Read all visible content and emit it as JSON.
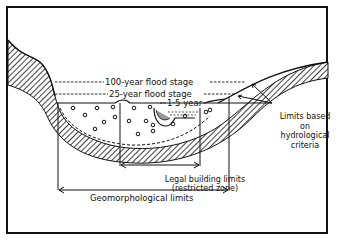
{
  "diagram": {
    "labels": {
      "flood_100": "100-year flood stage",
      "flood_25": "25-year flood stage",
      "flood_1_5": "1·5 year",
      "hydro_line1": "Limits based",
      "hydro_line2": "on",
      "hydro_line3": "hydrological",
      "hydro_line4": "criteria",
      "legal_line1": "Legal building limits",
      "legal_line2": "(restricted zone)",
      "geomorph": "Geomorphological limits"
    },
    "colors": {
      "ink": "#111111",
      "background": "#ffffff"
    }
  }
}
